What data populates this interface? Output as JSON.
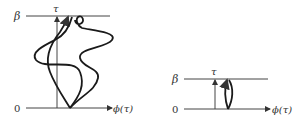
{
  "figure": {
    "left_panel": {
      "beta_label": "β",
      "zero_label": "0",
      "tau_label": "τ",
      "x_axis_label": "ϕ(τ)",
      "description": "Multiple winding field paths from 0 to β"
    },
    "right_panel": {
      "beta_label": "β",
      "zero_label": "0",
      "tau_label": "τ",
      "x_axis_label": "ϕ(τ)",
      "description": "Short closed loop path from 0 to β"
    },
    "colors": {
      "line": "#333333",
      "curve": "#1a1a1a",
      "background": "#ffffff"
    }
  }
}
